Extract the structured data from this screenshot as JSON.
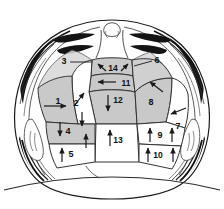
{
  "figure": {
    "view": "vertex (superior) view of head, face toward bottom",
    "colors": {
      "shaded_zone_fill": "#c9c9c9",
      "plain_zone_fill": "#ffffff",
      "outline": "#1a1a1a",
      "zone_border": "#333333",
      "skin": "#ffffff",
      "hair": "#111111",
      "arrow": "#1a1a1a",
      "background": "#ffffff"
    },
    "zones": [
      {
        "id": "1",
        "label": "1",
        "shaded": true,
        "arrow": "right",
        "lx": 58,
        "ly": 102
      },
      {
        "id": "2",
        "label": "2",
        "shaded": false,
        "arrow": "up-right",
        "lx": 76,
        "ly": 104
      },
      {
        "id": "3",
        "label": "3",
        "shaded": false,
        "arrow": "leader",
        "lx": 64,
        "ly": 62
      },
      {
        "id": "4",
        "label": "4",
        "shaded": true,
        "arrow": "down",
        "lx": 67,
        "ly": 132
      },
      {
        "id": "5",
        "label": "5",
        "shaded": false,
        "arrow": "up",
        "lx": 70,
        "ly": 155
      },
      {
        "id": "6",
        "label": "6",
        "shaded": false,
        "arrow": "leader",
        "lx": 157,
        "ly": 61
      },
      {
        "id": "7",
        "label": "7",
        "shaded": false,
        "arrow": "left-down",
        "lx": 178,
        "ly": 127
      },
      {
        "id": "8",
        "label": "8",
        "shaded": true,
        "arrow": "up-left",
        "lx": 151,
        "ly": 103
      },
      {
        "id": "9",
        "label": "9",
        "shaded": false,
        "arrow": "up",
        "lx": 160,
        "ly": 136
      },
      {
        "id": "10",
        "label": "10",
        "shaded": false,
        "arrow": "up",
        "lx": 157,
        "ly": 156
      },
      {
        "id": "11",
        "label": "11",
        "shaded": true,
        "arrow": "left",
        "lx": 125,
        "ly": 84
      },
      {
        "id": "12",
        "label": "12",
        "shaded": true,
        "arrow": "down",
        "lx": 117,
        "ly": 101
      },
      {
        "id": "13",
        "label": "13",
        "shaded": false,
        "arrow": "up",
        "lx": 117,
        "ly": 141
      },
      {
        "id": "14",
        "label": "14",
        "shaded": true,
        "arrow": "up-both",
        "lx": 110,
        "ly": 69
      }
    ],
    "zone_count": 14,
    "shaded_zone_ids": [
      "1",
      "4",
      "8",
      "11",
      "12",
      "14"
    ],
    "plain_zone_ids": [
      "2",
      "5",
      "7",
      "9",
      "10",
      "13"
    ],
    "leader_label_ids": [
      "3",
      "6"
    ],
    "arrow_directions": {
      "1": "right",
      "2": "up-right",
      "4": "down",
      "5": "up",
      "7": "left-down",
      "8": "up-left",
      "9": "up",
      "10": "up",
      "11": "left",
      "12": "down",
      "13": "up",
      "14": "up-left and up-right"
    }
  }
}
